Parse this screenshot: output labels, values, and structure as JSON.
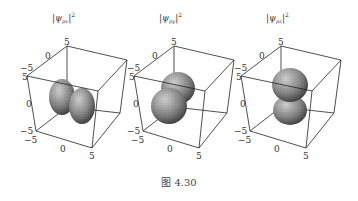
{
  "figure": {
    "caption": "图 4.30",
    "panels": [
      {
        "id": "px",
        "title_main": "|ψ",
        "title_sub": "px",
        "title_tail": "|",
        "title_sup": "2",
        "ticks": {
          "top_back": "5",
          "depth_mid": "0",
          "left_neg": "−5",
          "left_pos": "5",
          "vert_mid": "0",
          "bottom_neg1": "−5",
          "bottom_neg2": "−5",
          "bottom_mid": "0",
          "bottom_pos": "5"
        },
        "lobe_orientation": "x"
      },
      {
        "id": "py",
        "title_main": "|ψ",
        "title_sub": "py",
        "title_tail": "|",
        "title_sup": "2",
        "ticks": {
          "top_back": "5",
          "depth_mid": "0",
          "left_neg": "−5",
          "left_pos": "5",
          "vert_mid": "0",
          "bottom_neg1": "−5",
          "bottom_neg2": "−5",
          "bottom_mid": "0",
          "bottom_pos": "5"
        },
        "lobe_orientation": "y"
      },
      {
        "id": "pz",
        "title_main": "|ψ",
        "title_sub": "pz",
        "title_tail": "|",
        "title_sup": "2",
        "ticks": {
          "top_back": "5",
          "depth_mid": "0",
          "left_neg": "−5",
          "left_pos": "5",
          "vert_mid": "0",
          "bottom_neg1": "−5",
          "bottom_neg2": "−5",
          "bottom_mid": "0",
          "bottom_pos": "5"
        },
        "lobe_orientation": "z"
      }
    ],
    "axis_range": [
      -5,
      5
    ],
    "colors": {
      "surface_light": "#c8c8c8",
      "surface_dark": "#3a3a3a",
      "edge": "#222222"
    }
  }
}
